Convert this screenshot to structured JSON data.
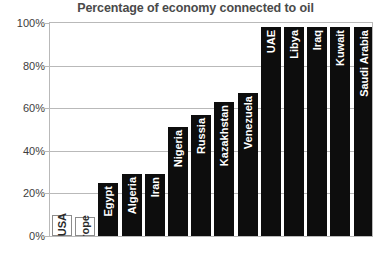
{
  "chart_data": {
    "type": "bar",
    "title": "Percentage of economy connected to oil",
    "xlabel": "",
    "ylabel": "",
    "ylim": [
      0,
      100
    ],
    "yticks": [
      "0%",
      "20%",
      "40%",
      "60%",
      "80%",
      "100%"
    ],
    "ytick_values": [
      0,
      20,
      40,
      60,
      80,
      100
    ],
    "grid": true,
    "legend": "none",
    "unit": "%",
    "categories": [
      "USA",
      "Western Europe",
      "Egypt",
      "Algeria",
      "Iran",
      "Nigeria",
      "Russia",
      "Kazakhstan",
      "Venezuela",
      "UAE",
      "Libya",
      "Iraq",
      "Kuwait",
      "Saudi Arabia"
    ],
    "values": [
      10,
      9,
      25,
      29,
      29,
      51,
      57,
      63,
      67,
      98,
      98,
      98,
      98,
      98
    ],
    "styles": [
      "hollow",
      "hollow",
      "filled",
      "filled",
      "filled",
      "filled",
      "filled",
      "filled",
      "filled",
      "filled",
      "filled",
      "filled",
      "filled",
      "filled"
    ],
    "colors": {
      "bar_filled": "#0d0d0d",
      "bar_hollow_fill": "#ffffff",
      "bar_hollow_border": "#8c8c8c",
      "grid": "#b9b9b9",
      "title": "#4a4a4a",
      "tick_text": "#3d3d3d",
      "background": "#ffffff"
    }
  }
}
